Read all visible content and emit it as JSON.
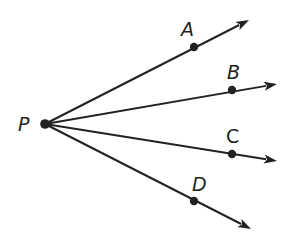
{
  "diagram": {
    "type": "rays-from-common-endpoint",
    "colors": {
      "stroke": "#222222",
      "background": "#ffffff"
    },
    "origin": {
      "label": "P",
      "x": 45,
      "y": 124,
      "label_x": 18,
      "label_y": 131
    },
    "rays": [
      {
        "label": "A",
        "point_x": 194,
        "point_y": 47,
        "tip_x": 249,
        "tip_y": 20,
        "label_x": 181,
        "label_y": 36
      },
      {
        "label": "B",
        "point_x": 232,
        "point_y": 90,
        "tip_x": 277,
        "tip_y": 84,
        "label_x": 227,
        "label_y": 79
      },
      {
        "label": "C",
        "point_x": 232,
        "point_y": 154,
        "tip_x": 277,
        "tip_y": 161,
        "label_x": 226,
        "label_y": 143
      },
      {
        "label": "D",
        "point_x": 194,
        "point_y": 201,
        "tip_x": 251,
        "tip_y": 229,
        "label_x": 192,
        "label_y": 191
      }
    ]
  }
}
